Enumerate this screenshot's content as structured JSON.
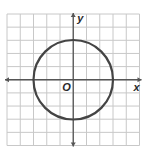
{
  "chart_data": {
    "type": "line",
    "title": "",
    "xlabel": "x",
    "ylabel": "y",
    "origin_label": "O",
    "xlim": [
      -5,
      5
    ],
    "ylim": [
      -5,
      5
    ],
    "grid": true,
    "grid_step": 1,
    "axes_arrows": true,
    "series": [
      {
        "name": "circle",
        "shape": "circle",
        "center": [
          0,
          0
        ],
        "radius": 3,
        "equation": "x^2 + y^2 = 9",
        "color": "#444444"
      }
    ]
  },
  "colors": {
    "grid": "#c8c8c8",
    "axis": "#555555",
    "curve": "#444444",
    "background": "#ffffff"
  }
}
